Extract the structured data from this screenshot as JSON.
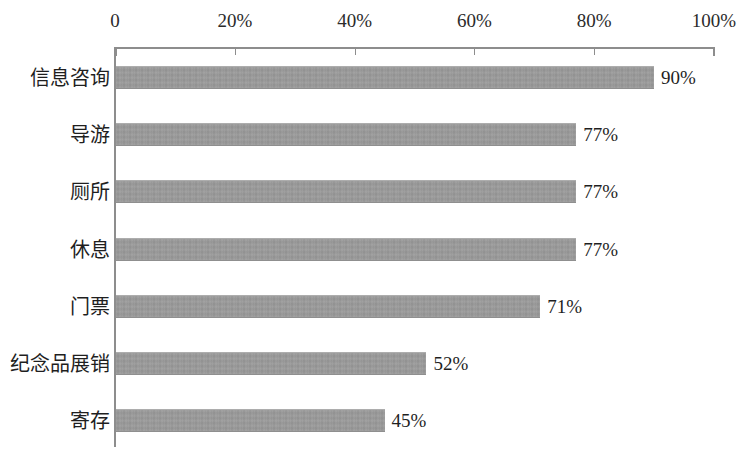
{
  "chart_data": {
    "type": "bar",
    "orientation": "horizontal",
    "title": "",
    "subtitle": "",
    "xlabel": "",
    "ylabel": "",
    "xlim": [
      0,
      100
    ],
    "grid": false,
    "legend": null,
    "axis_position": "top",
    "categories": [
      "信息咨询",
      "导游",
      "厕所",
      "休息",
      "门票",
      "纪念品展销",
      "寄存"
    ],
    "values": [
      90,
      77,
      77,
      77,
      71,
      52,
      45
    ],
    "value_labels": [
      "90%",
      "77%",
      "77%",
      "77%",
      "71%",
      "52%",
      "45%"
    ],
    "tick_values": [
      0,
      20,
      40,
      60,
      80,
      100
    ],
    "tick_labels": [
      "0",
      "20%",
      "40%",
      "60%",
      "80%",
      "100%"
    ],
    "bar_color": "#9b9b9b",
    "axis_color": "#8d8d8d",
    "text_color": "#1f1f1f",
    "background_color": "#ffffff"
  }
}
